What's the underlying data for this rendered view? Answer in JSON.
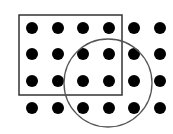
{
  "diagram": {
    "width": 173,
    "height": 134,
    "background": "#ffffff",
    "dot_color": "#000000",
    "dot_radius": 6,
    "columns_x": [
      32,
      58,
      83,
      109,
      134,
      160
    ],
    "rows_y": [
      28,
      54,
      81,
      108
    ],
    "rectangle": {
      "x": 19,
      "y": 15,
      "width": 103,
      "height": 80,
      "stroke": "#333333",
      "stroke_width": 1.5
    },
    "circle": {
      "cx": 108,
      "cy": 83,
      "r": 44,
      "stroke": "#555555",
      "stroke_width": 1.3
    }
  }
}
